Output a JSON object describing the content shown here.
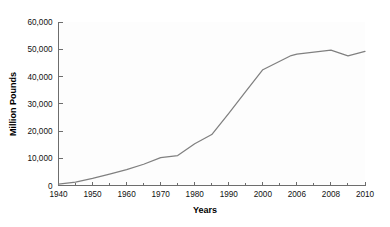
{
  "chart_data": {
    "type": "line",
    "title": "",
    "subtitle": "",
    "xlabel": "Years",
    "ylabel": "Million Pounds",
    "grid": false,
    "legend": false,
    "legend_position": "none",
    "line_color": "#808080",
    "axis_color": "#6d6d6d",
    "background_color": "#ffffff",
    "ylim": [
      0,
      60000
    ],
    "y_ticks": [
      0,
      10000,
      20000,
      30000,
      40000,
      50000,
      60000
    ],
    "y_tick_labels": [
      "0",
      "10,000",
      "20,000",
      "30,000",
      "40,000",
      "50,000",
      "60,000"
    ],
    "x_tick_labels": [
      "1940",
      "1950",
      "1960",
      "1970",
      "1980",
      "1990",
      "2000",
      "2006",
      "2008",
      "2010"
    ],
    "x_axis_note": "categorical-spaced year ticks with minor ticks at midpoints",
    "minor_ticks": true,
    "series": [
      {
        "name": "Million Pounds",
        "x": [
          "1940",
          "1945",
          "1950",
          "1955",
          "1960",
          "1965",
          "1970",
          "1975",
          "1980",
          "1985",
          "1990",
          "1995",
          "2000",
          "2005",
          "2006",
          "2008",
          "2009",
          "2010"
        ],
        "values": [
          500,
          1200,
          2600,
          4200,
          5800,
          7800,
          10200,
          11000,
          15300,
          18700,
          26500,
          34500,
          42500,
          47700,
          48200,
          49700,
          47600,
          49200
        ]
      }
    ]
  }
}
